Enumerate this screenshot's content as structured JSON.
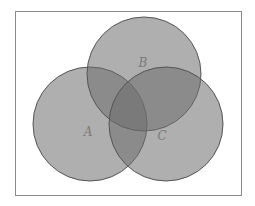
{
  "diagram": {
    "type": "venn",
    "frame": {
      "x": 15,
      "y": 11,
      "width": 226,
      "height": 184,
      "stroke": "#8a8a8a"
    },
    "fill_color": "#6e6e6e",
    "fill_opacity": 0.55,
    "stroke_color": "#555555",
    "sets": [
      {
        "label": "A",
        "cx": 90,
        "cy": 124,
        "r": 57,
        "label_x": 88,
        "label_y": 136
      },
      {
        "label": "B",
        "cx": 144,
        "cy": 74,
        "r": 57,
        "label_x": 143,
        "label_y": 67
      },
      {
        "label": "C",
        "cx": 166,
        "cy": 124,
        "r": 57,
        "label_x": 162,
        "label_y": 140
      }
    ]
  }
}
